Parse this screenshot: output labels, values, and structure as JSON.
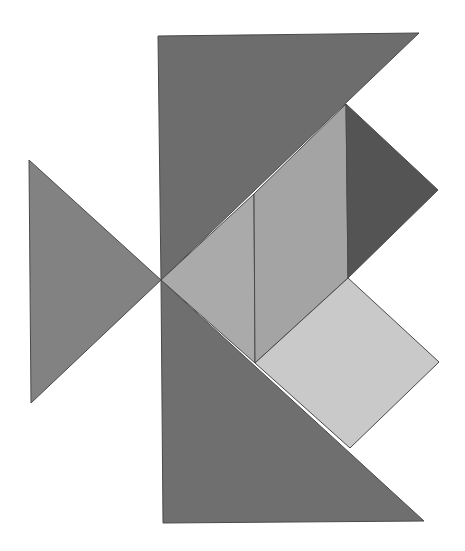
{
  "figure": {
    "title": "Tangram fish",
    "background": "#ffffff",
    "stroke": "#4a4a4a",
    "pieces": [
      {
        "name": "large-triangle-top",
        "shape": "triangle",
        "fill": "#6d6d6d",
        "points": "158,36 419,33 161,280"
      },
      {
        "name": "large-triangle-bottom",
        "shape": "triangle",
        "fill": "#6f6f6f",
        "points": "161,280 424,521 163,523"
      },
      {
        "name": "medium-triangle-tail",
        "shape": "triangle",
        "fill": "#828282",
        "points": "29,160 161,280 31,403"
      },
      {
        "name": "small-triangle-body",
        "shape": "triangle",
        "fill": "#aaaaaa",
        "points": "161,280 254,194 255,363"
      },
      {
        "name": "parallelogram",
        "shape": "parallelogram",
        "fill": "#a4a4a4",
        "points": "254,194 346,104 348,278 255,363"
      },
      {
        "name": "small-triangle-head",
        "shape": "triangle",
        "fill": "#545454",
        "points": "346,104 438,190 348,278"
      },
      {
        "name": "square",
        "shape": "square",
        "fill": "#c9c9c9",
        "points": "348,278 439,362 350,448 255,363"
      }
    ]
  }
}
